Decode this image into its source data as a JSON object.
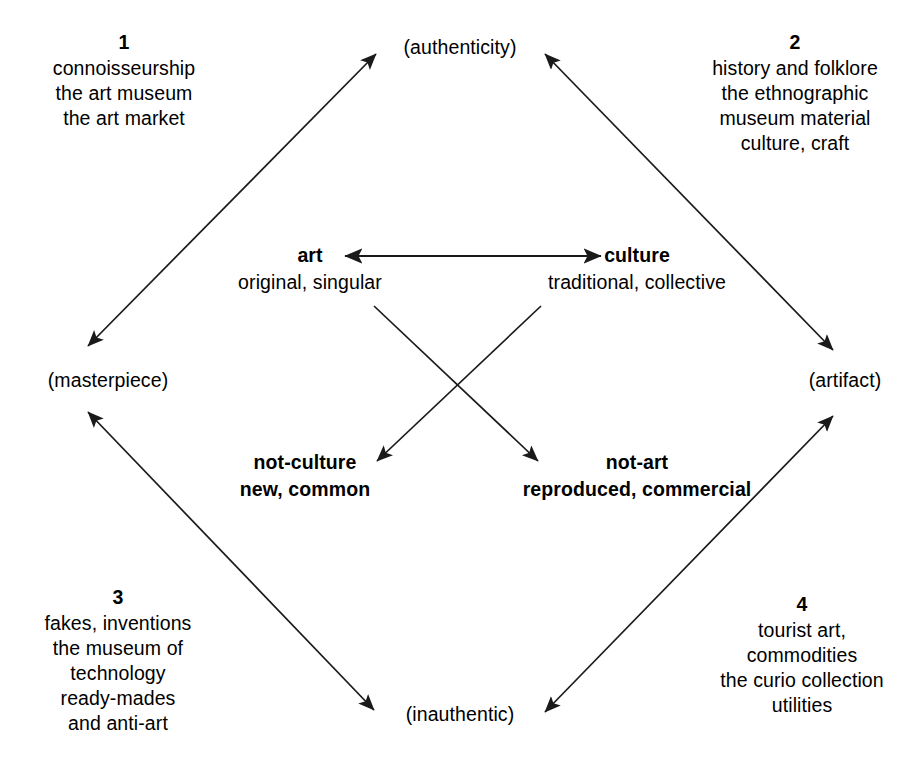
{
  "diagram": {
    "background_color": "#ffffff",
    "line_color": "#1a1a1a"
  },
  "poles": {
    "art": {
      "head": "art",
      "sub": "original, singular"
    },
    "culture": {
      "head": "culture",
      "sub": "traditional, collective"
    },
    "not_culture": {
      "head": "not-culture",
      "sub": "new, common"
    },
    "not_art": {
      "head": "not-art",
      "sub": "reproduced, commercial"
    }
  },
  "vertices": {
    "top": "(authenticity)",
    "left": "(masterpiece)",
    "right": "(artifact)",
    "bottom": "(inauthentic)"
  },
  "quadrants": [
    {
      "number": "1",
      "lines": [
        "connoisseurship",
        "the art museum",
        "the art market"
      ]
    },
    {
      "number": "2",
      "lines": [
        "history and folklore",
        "the ethnographic",
        "museum material",
        "culture, craft"
      ]
    },
    {
      "number": "3",
      "lines": [
        "fakes, inventions",
        "the museum of",
        "technology",
        "ready-mades",
        "and anti-art"
      ]
    },
    {
      "number": "4",
      "lines": [
        "tourist art,",
        "commodities",
        "the curio collection",
        "utilities"
      ]
    }
  ],
  "connections": [
    {
      "name": "art-culture",
      "from": "art",
      "to": "culture",
      "heads": "both"
    },
    {
      "name": "masterpiece-authenticity",
      "from": "(masterpiece)",
      "to": "(authenticity)",
      "heads": "both"
    },
    {
      "name": "authenticity-artifact",
      "from": "(authenticity)",
      "to": "(artifact)",
      "heads": "both"
    },
    {
      "name": "masterpiece-inauthentic",
      "from": "(masterpiece)",
      "to": "(inauthentic)",
      "heads": "both"
    },
    {
      "name": "inauthentic-artifact",
      "from": "(inauthentic)",
      "to": "(artifact)",
      "heads": "both"
    },
    {
      "name": "art-to-not-art",
      "from": "art",
      "to": "not-art",
      "heads": "end"
    },
    {
      "name": "culture-to-not-culture",
      "from": "culture",
      "to": "not-culture",
      "heads": "end"
    }
  ]
}
